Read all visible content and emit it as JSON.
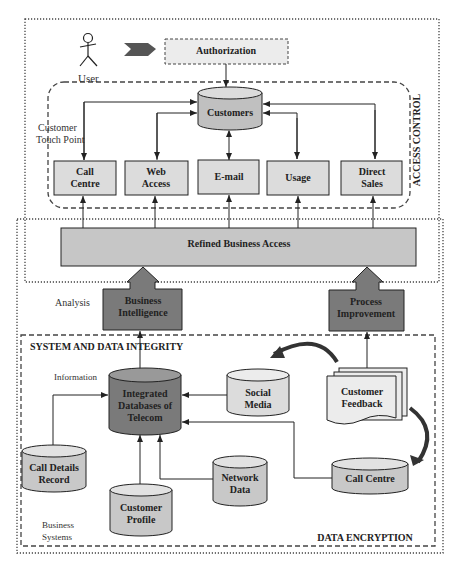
{
  "diagram": {
    "user": {
      "label": "User"
    },
    "authorization": {
      "label": "Authorization"
    },
    "customers": {
      "label": "Customers"
    },
    "touch_point_label": [
      "Customer",
      "Touch Point"
    ],
    "touch_points": [
      {
        "lines": [
          "Call",
          "Centre"
        ]
      },
      {
        "lines": [
          "Web",
          "Access"
        ]
      },
      {
        "lines": [
          "E-mail"
        ]
      },
      {
        "lines": [
          "Usage"
        ]
      },
      {
        "lines": [
          "Direct",
          "Sales"
        ]
      }
    ],
    "access_control_label": "ACCESS CONTROL",
    "refined_business_access": {
      "label": "Refined Business Access"
    },
    "analysis_label": "Analysis",
    "business_intelligence": {
      "lines": [
        "Business",
        "Intelligence"
      ]
    },
    "process_improvement": {
      "lines": [
        "Process",
        "Improvement"
      ]
    },
    "system_integrity_label": "SYSTEM AND DATA INTEGRITY",
    "information_label": "Information",
    "integrated_db": {
      "lines": [
        "Integrated",
        "Databases of",
        "Telecom"
      ]
    },
    "social_media": {
      "lines": [
        "Social",
        "Media"
      ]
    },
    "customer_feedback": {
      "lines": [
        "Customer",
        "Feedback"
      ]
    },
    "call_details_record": {
      "lines": [
        "Call Details",
        "Record"
      ]
    },
    "customer_profile": {
      "lines": [
        "Customer",
        "Profile"
      ]
    },
    "network_data": {
      "lines": [
        "Network",
        "Data"
      ]
    },
    "call_centre_db": {
      "lines": [
        "Call Centre"
      ]
    },
    "business_systems_label": [
      "Business",
      "Systems"
    ],
    "data_encryption_label": "DATA ENCRYPTION",
    "colors": {
      "light_fill": "#ececec",
      "mid_fill": "#c8c8c8",
      "dark_fill": "#7a7a7a",
      "stroke": "#222222"
    }
  }
}
